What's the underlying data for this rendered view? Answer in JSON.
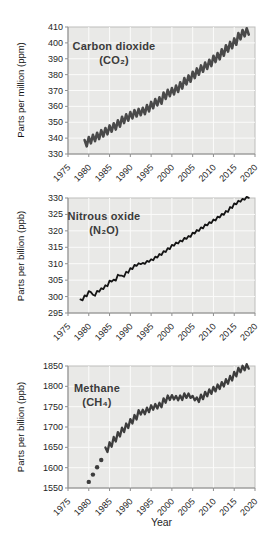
{
  "style": {
    "plot_bg": "#e9e9e7",
    "grid_color": "#fbfbfa",
    "frame_color": "#bdbdbb",
    "axis_color": "#8f8f8f",
    "tick_color": "#1f1f1f",
    "title_color": "#3b3b3b"
  },
  "chart_data": [
    {
      "type": "line",
      "title": "Carbon dioxide",
      "formula": "(CO₂)",
      "ylabel": "Parts per million (ppm)",
      "xlabel": "",
      "xlim": [
        1975,
        2020
      ],
      "xticks": [
        1975,
        1980,
        1985,
        1990,
        1995,
        2000,
        2005,
        2010,
        2015,
        2020
      ],
      "ylim": [
        330,
        410
      ],
      "yticks": [
        330,
        340,
        350,
        360,
        370,
        380,
        390,
        400,
        410
      ],
      "grid": true,
      "legend": "none",
      "line_color": "#4a4a4a",
      "line_width": 2.6,
      "seasonal_amplitude": 2.0,
      "x_start": 1979,
      "x_step": 1,
      "values": [
        336.8,
        338.7,
        340.1,
        341.4,
        343.0,
        344.4,
        346.0,
        347.4,
        349.2,
        351.5,
        353.0,
        354.4,
        355.6,
        356.4,
        357.1,
        358.8,
        360.8,
        362.6,
        363.7,
        366.7,
        368.4,
        369.5,
        371.1,
        373.2,
        375.8,
        377.5,
        379.8,
        381.9,
        383.8,
        385.6,
        387.4,
        389.9,
        391.6,
        393.9,
        396.5,
        398.6,
        400.8,
        404.2,
        406.1,
        407.2
      ]
    },
    {
      "type": "line",
      "title": "Nitrous oxide",
      "formula": "(N₂O)",
      "ylabel": "Parts per billion (ppb)",
      "xlabel": "",
      "xlim": [
        1975,
        2020
      ],
      "xticks": [
        1975,
        1980,
        1985,
        1990,
        1995,
        2000,
        2005,
        2010,
        2015,
        2020
      ],
      "ylim": [
        295,
        330
      ],
      "yticks": [
        295,
        300,
        305,
        310,
        315,
        320,
        325,
        330
      ],
      "grid": true,
      "legend": "none",
      "line_color": "#141414",
      "line_width": 1.8,
      "seasonal_amplitude": 0.15,
      "x_start": 1978,
      "x_step": 1,
      "values": [
        299.0,
        300.2,
        301.5,
        300.4,
        301.6,
        302.4,
        303.3,
        304.7,
        305.0,
        306.5,
        306.2,
        307.4,
        308.5,
        309.5,
        310.0,
        310.1,
        310.7,
        311.2,
        312.0,
        312.8,
        313.7,
        314.6,
        315.6,
        316.3,
        316.9,
        317.7,
        318.3,
        319.3,
        320.1,
        320.9,
        321.8,
        322.5,
        323.3,
        324.2,
        325.0,
        325.9,
        327.1,
        328.2,
        329.0,
        329.6,
        330.2
      ]
    },
    {
      "type": "line",
      "title": "Methane",
      "formula": "(CH₄)",
      "ylabel": "Parts per billion (ppb)",
      "xlabel": "Year",
      "xlim": [
        1975,
        2020
      ],
      "xticks": [
        1975,
        1980,
        1985,
        1990,
        1995,
        2000,
        2005,
        2010,
        2015,
        2020
      ],
      "ylim": [
        1550,
        1850
      ],
      "yticks": [
        1550,
        1600,
        1650,
        1700,
        1750,
        1800,
        1850
      ],
      "grid": true,
      "legend": "none",
      "line_color": "#3d3d3d",
      "line_width": 2.3,
      "seasonal_amplitude": 5.5,
      "x_start": 1984,
      "x_step": 1,
      "values": [
        1644,
        1657,
        1670,
        1682,
        1693,
        1703,
        1714,
        1724,
        1736,
        1737,
        1742,
        1748,
        1751,
        1754,
        1765,
        1772,
        1773,
        1771,
        1772,
        1777,
        1777,
        1771,
        1767,
        1774,
        1781,
        1787,
        1793,
        1799,
        1805,
        1812,
        1820,
        1830,
        1840,
        1845,
        1849
      ],
      "dots": {
        "x_start": 1980,
        "values": [
          1565,
          1583,
          1601,
          1619
        ]
      }
    }
  ]
}
